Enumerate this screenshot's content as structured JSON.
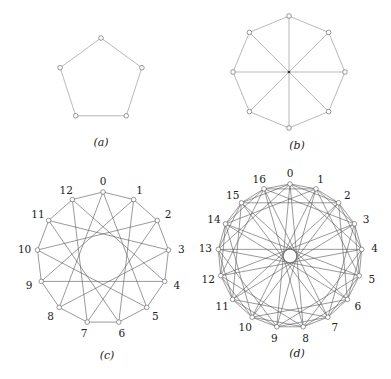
{
  "figure": {
    "panels": [
      {
        "id": "a",
        "caption": "(a)",
        "graph": "cycle",
        "vertex_count": 5,
        "labeled": false,
        "center": [
          101,
          81
        ],
        "radius": 43,
        "connections": [
          1
        ],
        "caption_pos": [
          101,
          142
        ]
      },
      {
        "id": "b",
        "caption": "(b)",
        "graph": "wheel-like octagon with diameters",
        "vertex_count": 8,
        "labeled": false,
        "center": [
          289,
          72
        ],
        "radius": 56,
        "connections": [
          1,
          4
        ],
        "caption_pos": [
          297,
          145
        ]
      },
      {
        "id": "c",
        "caption": "(c)",
        "graph": "circulant C13(1,5)",
        "vertex_count": 13,
        "labeled": true,
        "labels": [
          "0",
          "1",
          "2",
          "3",
          "4",
          "5",
          "6",
          "7",
          "8",
          "9",
          "10",
          "11",
          "12"
        ],
        "center": [
          103,
          258
        ],
        "radius": 66,
        "connections": [
          1,
          5
        ],
        "caption_pos": [
          107,
          355
        ]
      },
      {
        "id": "d",
        "caption": "(d)",
        "graph": "Paley graph P17",
        "vertex_count": 17,
        "labeled": true,
        "labels": [
          "0",
          "1",
          "2",
          "3",
          "4",
          "5",
          "6",
          "7",
          "8",
          "9",
          "10",
          "11",
          "12",
          "13",
          "14",
          "15",
          "16"
        ],
        "center": [
          290,
          256
        ],
        "radius": 72,
        "connections": [
          1,
          2,
          4,
          8
        ],
        "caption_pos": [
          297,
          353
        ]
      }
    ]
  }
}
